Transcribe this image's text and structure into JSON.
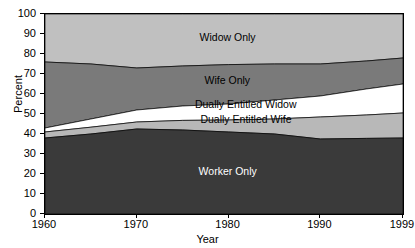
{
  "chart_data": {
    "type": "area",
    "title": "",
    "xlabel": "Year",
    "ylabel": "Percent",
    "ylim": [
      0,
      100
    ],
    "xlim": [
      1960,
      1999
    ],
    "grid": false,
    "legend_position": "inline-labels",
    "stacked": true,
    "x": [
      1960,
      1965,
      1970,
      1975,
      1980,
      1985,
      1990,
      1995,
      1999
    ],
    "series": [
      {
        "name": "Worker Only",
        "color": "#3a3a3a",
        "label_color": "#ffffff",
        "values": [
          38.0,
          40.0,
          42.5,
          42.0,
          41.0,
          40.0,
          37.5,
          37.8,
          38.0
        ],
        "cumulative": [
          38.0,
          40.0,
          42.5,
          42.0,
          41.0,
          40.0,
          37.5,
          37.8,
          38.0
        ]
      },
      {
        "name": "Dually Entitled Wife",
        "color": "#b8b8b8",
        "label_color": "#000000",
        "values": [
          3.0,
          3.4,
          3.5,
          4.8,
          6.0,
          7.5,
          11.0,
          11.7,
          12.5
        ],
        "cumulative": [
          41.0,
          43.4,
          46.0,
          46.8,
          47.0,
          47.5,
          48.5,
          49.5,
          50.5
        ]
      },
      {
        "name": "Dually Entitled Widow",
        "color": "#ffffff",
        "label_color": "#000000",
        "values": [
          2.0,
          4.1,
          6.0,
          7.2,
          8.0,
          9.5,
          10.5,
          13.0,
          14.5
        ],
        "cumulative": [
          43.0,
          47.5,
          52.0,
          54.0,
          55.0,
          57.0,
          59.0,
          62.5,
          65.0
        ]
      },
      {
        "name": "Wife Only",
        "color": "#7a7a7a",
        "label_color": "#ffffff",
        "values": [
          33.0,
          27.5,
          21.0,
          20.0,
          19.7,
          18.0,
          16.0,
          14.0,
          13.0
        ],
        "cumulative": [
          76.0,
          75.0,
          73.0,
          74.0,
          74.7,
          75.0,
          75.0,
          76.5,
          78.0
        ]
      },
      {
        "name": "Widow Only",
        "color": "#c0c0c0",
        "label_color": "#000000",
        "values": [
          24.0,
          25.0,
          27.0,
          26.0,
          25.3,
          25.0,
          25.0,
          23.5,
          22.0
        ],
        "cumulative": [
          100.0,
          100.0,
          100.0,
          100.0,
          100.0,
          100.0,
          100.0,
          100.0,
          100.0
        ]
      }
    ],
    "y_ticks": [
      0,
      10,
      20,
      30,
      40,
      50,
      60,
      70,
      80,
      90,
      100
    ],
    "x_ticks": [
      1960,
      1970,
      1980,
      1990,
      1999
    ]
  },
  "axes": {
    "y_label": "Percent",
    "x_label": "Year",
    "y_tick_labels": [
      "100",
      "90",
      "80",
      "70",
      "60",
      "50",
      "40",
      "30",
      "20",
      "10",
      "0"
    ],
    "x_tick_labels": [
      "1960",
      "1970",
      "1980",
      "1990",
      "1999"
    ]
  },
  "series_labels": [
    {
      "text": "Widow Only",
      "tone": "dark-text"
    },
    {
      "text": "Wife Only",
      "tone": "dark-text"
    },
    {
      "text": "Dually Entitled Widow",
      "tone": "dark-text"
    },
    {
      "text": "Dually Entitled Wife",
      "tone": "dark-text"
    },
    {
      "text": "Worker Only",
      "tone": "light-text"
    }
  ]
}
